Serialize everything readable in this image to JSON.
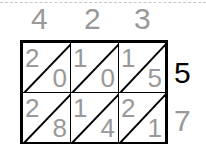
{
  "multiplicand": [
    "4",
    "2",
    "3"
  ],
  "multiplier": [
    "5",
    "7"
  ],
  "highlight_color": "#000000",
  "default_color": "#999999",
  "cells": [
    [
      {
        "tens": "2",
        "ones": "0"
      },
      {
        "tens": "1",
        "ones": "0"
      },
      {
        "tens": "1",
        "ones": "5",
        "highlight": true
      }
    ],
    [
      {
        "tens": "2",
        "ones": "8"
      },
      {
        "tens": "1",
        "ones": "4"
      },
      {
        "tens": "2",
        "ones": "1"
      }
    ]
  ]
}
